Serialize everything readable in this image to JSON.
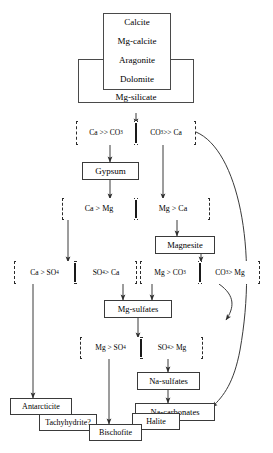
{
  "diagram": {
    "background_color": "#ffffff",
    "line_color": "#3a3a3a"
  },
  "source_stack": {
    "items": [
      {
        "label": "Calcite"
      },
      {
        "label": "Mg-calcite"
      },
      {
        "label": "Aragonite"
      },
      {
        "label": "Dolomite"
      },
      {
        "label": "Mg-silicate"
      }
    ]
  },
  "branches": {
    "b1": {
      "left": "Ca >> CO",
      "left_sub": "3",
      "right": "CO",
      "right_sub": "3",
      "right_tail": " >> Ca"
    },
    "b2": {
      "left": "Ca > Mg",
      "right": "Mg > Ca"
    },
    "b3": {
      "left": "Ca > SO",
      "left_sub": "4",
      "right": "SO",
      "right_sub": "4",
      "right_tail": " > Ca"
    },
    "b4": {
      "left": "Mg > CO",
      "left_sub": "3",
      "right": "CO",
      "right_sub": "3",
      "right_tail": " > Mg"
    },
    "b5": {
      "left": "Mg > SO",
      "left_sub": "4",
      "right": "SO",
      "right_sub": "4",
      "right_tail": " > Mg"
    }
  },
  "minerals": {
    "gypsum": "Gypsum",
    "magnesite": "Magnesite",
    "mg_sulfates": "Mg-sulfates",
    "na_sulfates": "Na-sulfates",
    "na_carbonates": "Na-carbonates",
    "antarcticite": "Antarcticite",
    "tachyhydrite": "Tachyhydrite?",
    "bischofite": "Bischofite",
    "halite": "Halite"
  }
}
